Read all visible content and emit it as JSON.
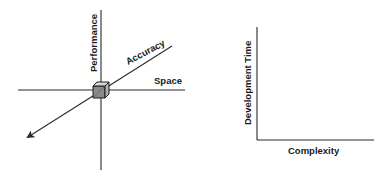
{
  "left_diagram": {
    "axes": {
      "vertical": "Performance",
      "horizontal": "Space",
      "diagonal": "Accuracy"
    },
    "origin_marker": "cube-icon"
  },
  "right_diagram": {
    "axes": {
      "vertical": "Development Time",
      "horizontal": "Complexity"
    }
  }
}
